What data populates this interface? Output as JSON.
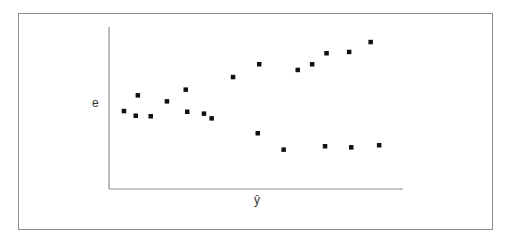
{
  "chart_data": {
    "type": "scatter",
    "title": "",
    "xlabel": "ŷ",
    "ylabel": "e",
    "xlim": [
      0,
      100
    ],
    "ylim": [
      0,
      100
    ],
    "grid": false,
    "legend": null,
    "ticks": "none",
    "marker": "square",
    "marker_color": "#111111",
    "axis_color": "#8f8f8f",
    "frame_color": "#8c8c8c",
    "series": [
      {
        "name": "residuals",
        "points": [
          {
            "x": 5.1,
            "y": 48.1
          },
          {
            "x": 9.1,
            "y": 45.2
          },
          {
            "x": 9.8,
            "y": 57.8
          },
          {
            "x": 14.2,
            "y": 44.9
          },
          {
            "x": 19.7,
            "y": 54.1
          },
          {
            "x": 26.1,
            "y": 61.3
          },
          {
            "x": 26.6,
            "y": 47.7
          },
          {
            "x": 32.3,
            "y": 46.5
          },
          {
            "x": 34.9,
            "y": 43.6
          },
          {
            "x": 42.2,
            "y": 69.1
          },
          {
            "x": 51.1,
            "y": 77.0
          },
          {
            "x": 50.6,
            "y": 34.4
          },
          {
            "x": 59.4,
            "y": 24.3
          },
          {
            "x": 64.2,
            "y": 73.5
          },
          {
            "x": 69.1,
            "y": 77.0
          },
          {
            "x": 74.0,
            "y": 83.8
          },
          {
            "x": 73.5,
            "y": 26.4
          },
          {
            "x": 81.7,
            "y": 84.6
          },
          {
            "x": 82.4,
            "y": 25.7
          },
          {
            "x": 89.0,
            "y": 90.7
          },
          {
            "x": 91.9,
            "y": 27.0
          }
        ]
      }
    ]
  },
  "labels": {
    "x": "ŷ",
    "y": "e"
  }
}
